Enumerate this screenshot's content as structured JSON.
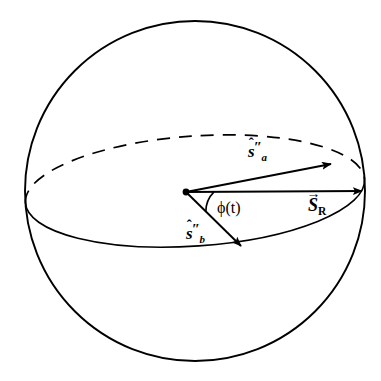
{
  "figure": {
    "background_color": "#ffffff",
    "stroke_color": "#000000",
    "sphere": {
      "name": "sphere-outline",
      "center_x": 195,
      "center_y": 191,
      "radius": 170
    },
    "equator": {
      "name": "equatorial-ellipse",
      "center_x": 195,
      "center_y": 191,
      "radius_x": 170,
      "radius_y": 55,
      "tilt_degrees": -4,
      "front_style": "solid",
      "back_style": "dashed"
    },
    "origin": {
      "name": "origin-point",
      "x": 186,
      "y": 192
    },
    "vectors": [
      {
        "id": "s-a",
        "label": "s",
        "accent": "hat",
        "subscript": "a",
        "prime": "″",
        "from_x": 186,
        "from_y": 192,
        "to_x": 331,
        "to_y": 164
      },
      {
        "id": "s-r",
        "label": "S",
        "accent": "arrow",
        "subscript": "R",
        "prime": "",
        "from_x": 186,
        "from_y": 192,
        "to_x": 362,
        "to_y": 191
      },
      {
        "id": "s-b",
        "label": "s",
        "accent": "hat",
        "subscript": "b",
        "prime": "″",
        "from_x": 186,
        "from_y": 192,
        "to_x": 241,
        "to_y": 246
      }
    ],
    "angle": {
      "name": "phi-angle-arc",
      "label": "ϕ(t)",
      "vertex_x": 186,
      "vertex_y": 192,
      "radius": 28
    },
    "marks": {
      "hat": "ˆ",
      "vector_arrow": "→",
      "double_prime": "″"
    }
  }
}
